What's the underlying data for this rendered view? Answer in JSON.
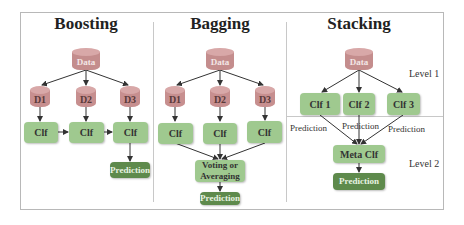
{
  "colors": {
    "data_cylinder": "#c48d8d",
    "dataset_cylinder": "#c78f8f",
    "classifier_box": "#9fc98f",
    "prediction_box": "#5e8a4c",
    "arrows": "#333333",
    "frame": "#b8b8b8"
  },
  "boosting": {
    "title": "Boosting",
    "data": "Data",
    "datasets": [
      "D1",
      "D2",
      "D3"
    ],
    "classifiers": [
      "Clf",
      "Clf",
      "Clf"
    ],
    "prediction": "Prediction"
  },
  "bagging": {
    "title": "Bagging",
    "data": "Data",
    "datasets": [
      "D1",
      "D2",
      "D3"
    ],
    "classifiers": [
      "Clf",
      "Clf",
      "Clf"
    ],
    "aggregator": "Voting or Averaging",
    "prediction": "Prediction"
  },
  "stacking": {
    "title": "Stacking",
    "data": "Data",
    "level1": "Level 1",
    "level2": "Level 2",
    "classifiers": [
      "Clf 1",
      "Clf 2",
      "Clf 3"
    ],
    "edge_labels": [
      "Prediction",
      "Prediction",
      "Prediction"
    ],
    "meta": "Meta Clf",
    "prediction": "Prediction"
  }
}
